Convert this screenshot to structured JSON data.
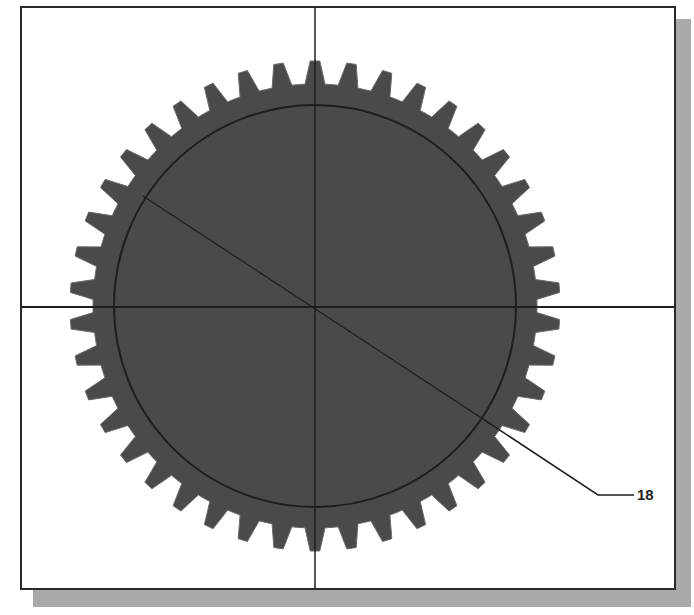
{
  "figure": {
    "type": "gear-drawing",
    "gear": {
      "teeth": 42,
      "center": [
        315,
        306
      ],
      "pitch_radius": 201,
      "outer_radius": 245,
      "root_radius": 222,
      "fill_color": "#4a4a4a",
      "line_color": "#1e1e1e"
    },
    "centerlines": {
      "horizontal_y": 307,
      "vertical_x": 315
    },
    "diameter_dimension": {
      "start": [
        143,
        196
      ],
      "end": [
        483,
        419
      ],
      "leader_elbow": [
        598,
        495
      ],
      "leader_end": [
        634,
        495
      ]
    },
    "callout_label": "18",
    "colors": {
      "frame_border": "#2a2a2a",
      "shadow": "#a9a9a9",
      "background": "#ffffff"
    }
  }
}
